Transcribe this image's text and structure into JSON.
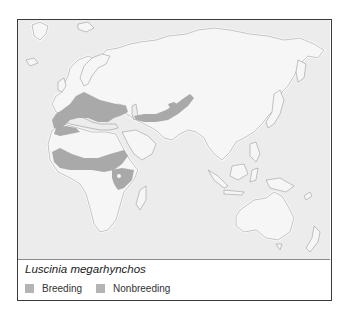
{
  "map": {
    "region": "Europe, Africa, Asia, Australia",
    "species_name": "Luscinia megarhynchos",
    "range_color": "#a9a9a9",
    "land_color": "#f6f6f6",
    "ocean_color": "#ececec",
    "ranges": [
      {
        "type": "breeding",
        "area": "Europe / Mediterranean / North Africa coast"
      },
      {
        "type": "breeding",
        "area": "Central Asia / Kazakhstan"
      },
      {
        "type": "nonbreeding",
        "area": "Sub-Saharan Sahel band"
      },
      {
        "type": "nonbreeding",
        "area": "East Africa"
      }
    ]
  },
  "legend": {
    "items": [
      {
        "label": "Breeding",
        "color": "#b4b4b4"
      },
      {
        "label": "Nonbreeding",
        "color": "#b4b4b4"
      }
    ]
  }
}
